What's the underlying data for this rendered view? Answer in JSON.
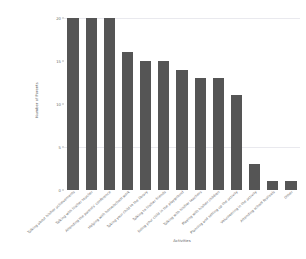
{
  "chart_data": {
    "type": "bar",
    "title": "",
    "xlabel": "Activities",
    "ylabel": "Number of Parents",
    "categories": [
      "Talking about his/her achievements at school",
      "Talking with his/her teacher",
      "Attending the parents' evening/conference",
      "Reading with his/her homework",
      "Taking your child to the library",
      "Talking to his/her friends",
      "Taking your child to the theatre",
      "Doing sport with his/her homework",
      "Helping with his/her homework",
      "Talking with his/her friends",
      "Planning and setting up the activities",
      "Volunteering in his/her activity",
      "Other"
    ],
    "categories_short": [
      "Talking about his/her achievements",
      "Talking with his/her teacher",
      "Attending the parents' conference",
      "Helping with home/school work",
      "Taking your child to the library",
      "Talking to his/her friends",
      "Doing your child in the playground",
      "Talking with his/her teachers",
      "Playing with his/her children",
      "Planning and setting up the activity",
      "Volunteering in the activity",
      "Attending school festivals",
      "Other"
    ],
    "values": [
      20,
      20,
      20,
      16,
      15,
      15,
      14,
      13,
      13,
      11,
      3,
      1,
      1
    ],
    "ylim": [
      0,
      20
    ],
    "yticks": [
      0,
      5,
      10,
      15,
      20
    ],
    "ytick_labels": [
      "0",
      "5",
      "10",
      "15",
      "20"
    ],
    "gridlines": [
      5,
      20
    ],
    "grid": true,
    "legend": "none",
    "bar_color": "#555555",
    "grid_color": "#e9e9ee",
    "background": "#ffffff"
  }
}
